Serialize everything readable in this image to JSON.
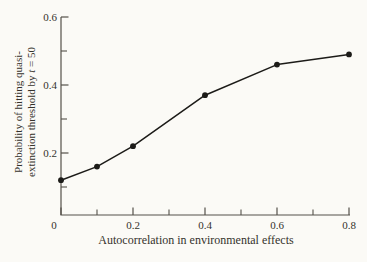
{
  "chart_data": {
    "type": "line",
    "title": "",
    "x": [
      0,
      0.1,
      0.2,
      0.4,
      0.6,
      0.8
    ],
    "y": [
      0.12,
      0.16,
      0.22,
      0.37,
      0.46,
      0.49
    ],
    "series": [
      {
        "name": "quasi-extinction probability",
        "values": [
          0.12,
          0.16,
          0.22,
          0.37,
          0.46,
          0.49
        ]
      }
    ],
    "xlabel": "Autocorrelation in environmental effects",
    "ylabel_line1": "Probability of hitting quasi-",
    "ylabel_line2_pre": "extinction threshold by ",
    "ylabel_line2_var": "t",
    "ylabel_line2_post": " = 50",
    "xlim": [
      0,
      0.8
    ],
    "ylim": [
      0,
      0.6
    ],
    "x_ticks": {
      "major": [
        0,
        0.2,
        0.4,
        0.6,
        0.8
      ],
      "labels": [
        "0",
        "0.2",
        "0.4",
        "0.6",
        "0.8"
      ],
      "minor": [
        0.1,
        0.3,
        0.5,
        0.7
      ]
    },
    "y_ticks": {
      "major": [
        0.2,
        0.4,
        0.6
      ],
      "labels": [
        "0.2",
        "0.4",
        "0.6"
      ],
      "minor": [
        0.1,
        0.3,
        0.5
      ]
    },
    "grid": false,
    "legend": false,
    "marker": "filled-circle",
    "colors": {
      "line": "#1c1b18",
      "marker": "#1c1b18",
      "axis": "#55514a",
      "text": "#35322c",
      "background": "#fbfaf6"
    }
  }
}
